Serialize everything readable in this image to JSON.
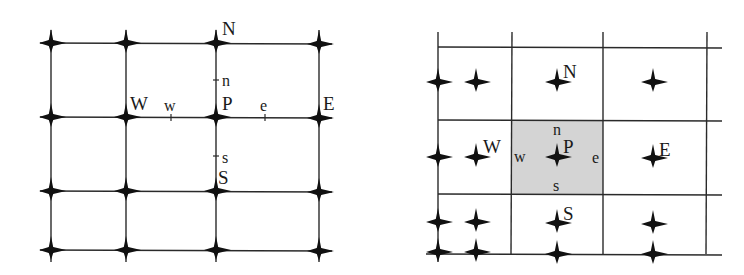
{
  "colors": {
    "line": "#2a2a2a",
    "node": "#111111",
    "shade": "#d4d4d4",
    "background": "#ffffff"
  },
  "left_diagram": {
    "name": "vertex-centered-grid",
    "labels": {
      "N": "N",
      "W": "W",
      "P": "P",
      "E": "E",
      "S": "S",
      "n": "n",
      "w": "w",
      "e": "e",
      "s": "s"
    }
  },
  "right_diagram": {
    "name": "cell-centered-control-volume",
    "labels": {
      "N": "N",
      "W": "W",
      "P": "P",
      "E": "E",
      "S": "S",
      "n": "n",
      "w": "w",
      "e": "e",
      "s": "s"
    }
  }
}
